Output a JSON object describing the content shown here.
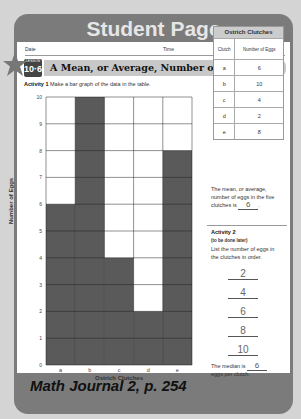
{
  "banner": {
    "title": "Student Page"
  },
  "header": {
    "date_label": "Date",
    "time_label": "Time"
  },
  "lesson": {
    "label": "LESSON",
    "number": "10·6",
    "title": "A Mean, or Average, Number of Eggs"
  },
  "activity1": {
    "label": "Activity 1",
    "instruction": "Make a bar graph of the data in the table."
  },
  "table": {
    "title": "Ostrich Clutches",
    "headers": [
      "Clutch",
      "Number of Eggs"
    ],
    "rows": [
      [
        "a",
        "6"
      ],
      [
        "b",
        "10"
      ],
      [
        "c",
        "4"
      ],
      [
        "d",
        "2"
      ],
      [
        "e",
        "8"
      ]
    ]
  },
  "mean": {
    "text_before": "The mean, or average, number of eggs in the five clutches is",
    "value": "6"
  },
  "activity2": {
    "label": "Activity 2",
    "note": "(to be done later)",
    "instruction": "List the number of eggs in the clutches in order.",
    "ordered": [
      "2",
      "4",
      "6",
      "8",
      "10"
    ],
    "median_before": "The median is",
    "median_value": "6",
    "median_after": "eggs per clutch."
  },
  "footer": {
    "text": "Math Journal 2, p. 254"
  },
  "chart_data": {
    "type": "bar",
    "title": "",
    "categories": [
      "a",
      "b",
      "c",
      "d",
      "e"
    ],
    "values": [
      6,
      10,
      4,
      2,
      8
    ],
    "xlabel": "Ostrich Clutches",
    "ylabel": "Number of Eggs",
    "ylim": [
      0,
      10
    ],
    "yticks": [
      0,
      1,
      2,
      3,
      4,
      5,
      6,
      7,
      8,
      9,
      10
    ],
    "grid": true,
    "bar_color": "#5a5a5a"
  }
}
